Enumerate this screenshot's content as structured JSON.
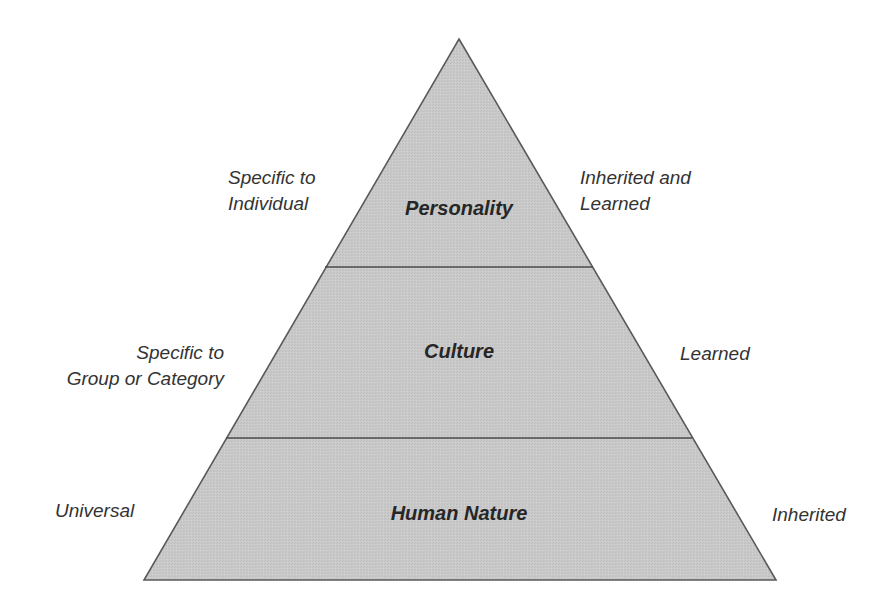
{
  "diagram": {
    "type": "pyramid",
    "colors": {
      "fill": "#c8c8c8",
      "stroke": "#5a5a5a",
      "text": "#333333",
      "background": "#ffffff"
    },
    "levels": [
      {
        "name": "Personality",
        "left_label": [
          "Specific to",
          "Individual"
        ],
        "right_label": [
          "Inherited and",
          "Learned"
        ]
      },
      {
        "name": "Culture",
        "left_label": [
          "Specific to",
          "Group or Category"
        ],
        "right_label": [
          "Learned"
        ]
      },
      {
        "name": "Human Nature",
        "left_label": [
          "Universal"
        ],
        "right_label": [
          "Inherited"
        ]
      }
    ]
  }
}
